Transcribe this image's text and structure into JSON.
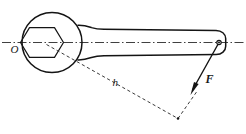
{
  "figure": {
    "background_color": "#ffffff",
    "line_color": "#141414",
    "labels": {
      "pivot": "O",
      "moment_arm": "h",
      "force": "F"
    },
    "parts": {
      "head": "wrench-head-circle",
      "socket": "hexagonal-nut",
      "handle": "wrench-handle",
      "axis": "centerline-axis",
      "arm": "moment-arm-dashed",
      "force": "force-vector"
    }
  }
}
